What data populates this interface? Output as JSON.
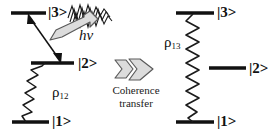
{
  "figure": {
    "background_color": "#ffffff",
    "line_color": "#111111",
    "arrow_fill_color": "#d9d9d9",
    "arrow_stroke_color": "#555555"
  },
  "left_diagram": {
    "name": "rho-12 coherence level scheme",
    "levels": [
      {
        "id": "level-3",
        "label": "|3>"
      },
      {
        "id": "level-2",
        "label": "|2>"
      },
      {
        "id": "level-1",
        "label": "|1>"
      }
    ],
    "coherence_label": "ρ",
    "coherence_subscript": "12",
    "photon_label": "hν",
    "photon_icon": "wavy-photon-icon",
    "excitation_arrow_icon": "double-headed-arrow-icon",
    "emission_arrow_icon": "hollow-gray-arrow-icon"
  },
  "center": {
    "arrow_icon": "double-chevron-right-icon",
    "caption_line_1": "Coherence",
    "caption_line_2": "transfer"
  },
  "right_diagram": {
    "name": "rho-13 coherence level scheme",
    "levels": [
      {
        "id": "level-3",
        "label": "|3>"
      },
      {
        "id": "level-2",
        "label": "|2>"
      },
      {
        "id": "level-1",
        "label": "|1>"
      }
    ],
    "coherence_label": "ρ",
    "coherence_subscript": "13",
    "coherence_icon": "vertical-zigzag-icon"
  }
}
